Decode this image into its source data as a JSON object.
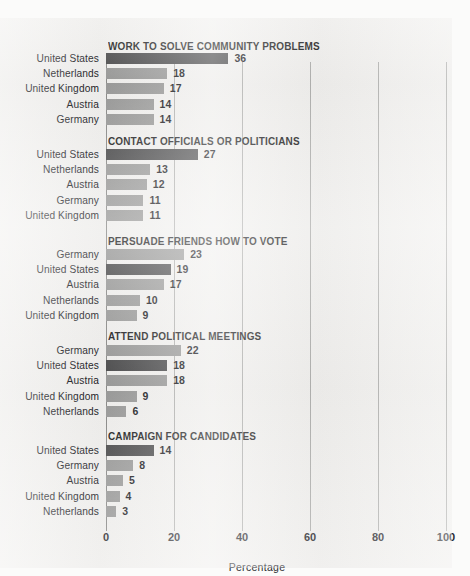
{
  "chart_data": {
    "type": "bar",
    "title": "",
    "xlabel": "Percentage",
    "ylabel": "",
    "xlim": [
      0,
      100
    ],
    "xticks": [
      0,
      20,
      40,
      60,
      80,
      100
    ],
    "grid": true,
    "orientation": "horizontal",
    "legend": "none",
    "highlight_category": "United States",
    "colors": {
      "bar": "#9a9a99",
      "bar_highlight": "#4c4c4d",
      "background": "#f1f0ee",
      "gridline": "#b0b0ae",
      "text": "#18181c"
    },
    "groups": [
      {
        "title": "WORK TO SOLVE COMMUNITY PROBLEMS",
        "categories": [
          "United States",
          "Netherlands",
          "United Kingdom",
          "Austria",
          "Germany"
        ],
        "values": [
          36,
          18,
          17,
          14,
          14
        ]
      },
      {
        "title": "CONTACT OFFICIALS OR POLITICIANS",
        "categories": [
          "United States",
          "Netherlands",
          "Austria",
          "Germany",
          "United Kingdom"
        ],
        "values": [
          27,
          13,
          12,
          11,
          11
        ]
      },
      {
        "title": "PERSUADE FRIENDS HOW TO VOTE",
        "categories": [
          "Germany",
          "United States",
          "Austria",
          "Netherlands",
          "United Kingdom"
        ],
        "values": [
          23,
          19,
          17,
          10,
          9
        ]
      },
      {
        "title": "ATTEND POLITICAL MEETINGS",
        "categories": [
          "Germany",
          "United States",
          "Austria",
          "United Kingdom",
          "Netherlands"
        ],
        "values": [
          22,
          18,
          18,
          9,
          6
        ]
      },
      {
        "title": "CAMPAIGN FOR CANDIDATES",
        "categories": [
          "United States",
          "Germany",
          "Austria",
          "United Kingdom",
          "Netherlands"
        ],
        "values": [
          14,
          8,
          5,
          4,
          3
        ]
      }
    ]
  }
}
